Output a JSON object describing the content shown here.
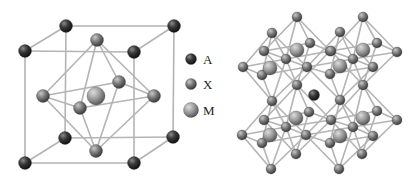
{
  "figure": {
    "colors": {
      "background": "#ffffff",
      "bond": "#b4b4b4",
      "A": "#2a2a2a",
      "X": "#7c7c7c",
      "M": "#9a9a9a"
    },
    "legend": [
      {
        "symbol": "A",
        "label": "A",
        "cx": 191,
        "cy": 59,
        "r": 5.5,
        "label_x": 203,
        "label_y": 52
      },
      {
        "symbol": "X",
        "label": "X",
        "cx": 191,
        "cy": 84,
        "r": 5.5,
        "label_x": 203,
        "label_y": 77
      },
      {
        "symbol": "M",
        "label": "M",
        "cx": 191,
        "cy": 110,
        "r": 7.5,
        "label_x": 203,
        "label_y": 103
      }
    ],
    "unit_cell": {
      "atoms": [
        {
          "id": "a_ftl",
          "type": "A",
          "x": 25,
          "y": 51,
          "r": 6.5
        },
        {
          "id": "a_btl",
          "type": "A",
          "x": 66,
          "y": 26,
          "r": 6.5
        },
        {
          "id": "a_btr",
          "type": "A",
          "x": 174,
          "y": 26,
          "r": 6.5
        },
        {
          "id": "a_ftr",
          "type": "A",
          "x": 134,
          "y": 52,
          "r": 6.5
        },
        {
          "id": "a_fbl",
          "type": "A",
          "x": 25,
          "y": 163,
          "r": 6.5
        },
        {
          "id": "a_bbl",
          "type": "A",
          "x": 65,
          "y": 138,
          "r": 6.5
        },
        {
          "id": "a_bbr",
          "type": "A",
          "x": 173,
          "y": 137,
          "r": 6.5
        },
        {
          "id": "a_fbr",
          "type": "A",
          "x": 134,
          "y": 163,
          "r": 6.5
        },
        {
          "id": "x_top",
          "type": "X",
          "x": 97,
          "y": 40,
          "r": 6.5
        },
        {
          "id": "x_left",
          "type": "X",
          "x": 43,
          "y": 96,
          "r": 6.5
        },
        {
          "id": "x_back",
          "type": "X",
          "x": 119,
          "y": 82,
          "r": 6.5
        },
        {
          "id": "x_right",
          "type": "X",
          "x": 154,
          "y": 96,
          "r": 6.5
        },
        {
          "id": "m_center",
          "type": "M",
          "x": 96,
          "y": 96,
          "r": 9
        },
        {
          "id": "x_front",
          "type": "X",
          "x": 80,
          "y": 108,
          "r": 6.5
        },
        {
          "id": "x_bottom",
          "type": "X",
          "x": 96,
          "y": 151,
          "r": 6.5
        }
      ],
      "bonds": [
        [
          "a_ftl",
          "a_ftr"
        ],
        [
          "a_ftl",
          "a_btl"
        ],
        [
          "a_btl",
          "a_btr"
        ],
        [
          "a_ftr",
          "a_btr"
        ],
        [
          "a_fbl",
          "a_fbr"
        ],
        [
          "a_fbl",
          "a_bbl"
        ],
        [
          "a_bbl",
          "a_bbr"
        ],
        [
          "a_fbr",
          "a_bbr"
        ],
        [
          "a_ftl",
          "a_fbl"
        ],
        [
          "a_ftr",
          "a_fbr"
        ],
        [
          "a_btl",
          "a_bbl"
        ],
        [
          "a_btr",
          "a_bbr"
        ],
        [
          "x_top",
          "x_left"
        ],
        [
          "x_top",
          "x_right"
        ],
        [
          "x_top",
          "x_front"
        ],
        [
          "x_top",
          "x_back"
        ],
        [
          "x_bottom",
          "x_left"
        ],
        [
          "x_bottom",
          "x_right"
        ],
        [
          "x_bottom",
          "x_front"
        ],
        [
          "x_bottom",
          "x_back"
        ],
        [
          "x_left",
          "x_front"
        ],
        [
          "x_front",
          "x_right"
        ],
        [
          "x_right",
          "x_back"
        ],
        [
          "x_back",
          "x_left"
        ]
      ]
    },
    "network": {
      "octahedra": [
        {
          "center": [
            297,
            50
          ],
          "apex_top": [
            297,
            17
          ],
          "apex_bottom": [
            297,
            85
          ],
          "equator": [
            [
              264,
              51
            ],
            [
              310,
              43
            ],
            [
              330,
              51
            ],
            [
              286,
              59
            ]
          ],
          "front_center": [
            270,
            68
          ]
        },
        {
          "center": [
            363,
            50
          ],
          "apex_top": [
            363,
            17
          ],
          "apex_bottom": [
            363,
            85
          ],
          "equator": [
            [
              331,
              51
            ],
            [
              377,
              43
            ],
            [
              397,
              52
            ],
            [
              353,
              59
            ]
          ],
          "front_center": [
            340,
            66
          ]
        },
        {
          "center": [
            296,
            118
          ],
          "apex_top": [
            297,
            85
          ],
          "apex_bottom": [
            296,
            154
          ],
          "equator": [
            [
              264,
              120
            ],
            [
              309,
              112
            ],
            [
              331,
              120
            ],
            [
              286,
              127
            ]
          ],
          "front_center": [
            270,
            135
          ]
        },
        {
          "center": [
            363,
            118
          ],
          "apex_top": [
            363,
            85
          ],
          "apex_bottom": [
            362,
            154
          ],
          "equator": [
            [
              331,
              120
            ],
            [
              377,
              111
            ],
            [
              397,
              120
            ],
            [
              353,
              127
            ]
          ],
          "front_center": [
            340,
            136
          ]
        }
      ],
      "front_octahedra": [
        {
          "center": [
            270,
            68
          ],
          "top": [
            272,
            33
          ],
          "bottom": [
            272,
            101
          ],
          "equator": [
            [
              243,
              67
            ],
            [
              286,
              59
            ],
            [
              307,
              67
            ],
            [
              262,
              75
            ]
          ]
        },
        {
          "center": [
            340,
            66
          ],
          "top": [
            340,
            32
          ],
          "bottom": [
            340,
            100
          ],
          "equator": [
            [
              307,
              67
            ],
            [
              353,
              59
            ],
            [
              373,
              67
            ],
            [
              330,
              74
            ]
          ]
        },
        {
          "center": [
            270,
            135
          ],
          "top": [
            272,
            101
          ],
          "bottom": [
            271,
            169
          ],
          "equator": [
            [
              242,
              135
            ],
            [
              286,
              127
            ],
            [
              306,
              135
            ],
            [
              262,
              143
            ]
          ]
        },
        {
          "center": [
            340,
            136
          ],
          "top": [
            340,
            100
          ],
          "bottom": [
            339,
            169
          ],
          "equator": [
            [
              306,
              135
            ],
            [
              353,
              127
            ],
            [
              373,
              136
            ],
            [
              330,
              143
            ]
          ]
        }
      ],
      "center_atom": {
        "type": "A",
        "x": 314,
        "y": 95,
        "r": 5.5
      },
      "x_radius": 5,
      "m_radius": 7
    }
  }
}
